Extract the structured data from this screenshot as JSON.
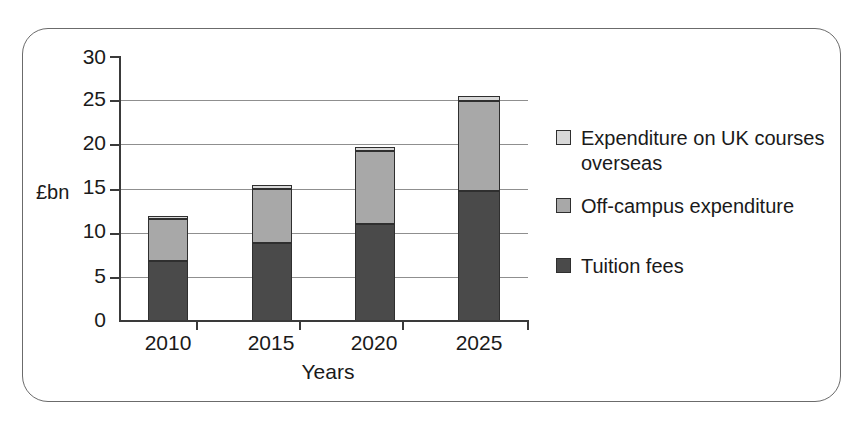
{
  "chart_data": {
    "type": "bar",
    "subtype": "stacked-vertical",
    "title": "",
    "xlabel": "Years",
    "ylabel": "£bn",
    "categories": [
      "2010",
      "2015",
      "2020",
      "2025"
    ],
    "series": [
      {
        "name": "Tuition fees",
        "color": "#4a4a4a",
        "values": [
          6.8,
          8.8,
          11.0,
          14.7
        ]
      },
      {
        "name": "Off-campus expenditure",
        "color": "#a8a8a8",
        "values": [
          4.7,
          6.2,
          8.2,
          10.2
        ]
      },
      {
        "name": "Expenditure on UK courses overseas",
        "color": "#d8d8d8",
        "values": [
          0.4,
          0.35,
          0.45,
          0.55
        ]
      }
    ],
    "totals": [
      11.9,
      15.35,
      19.65,
      25.45
    ],
    "ylim": [
      0,
      30
    ],
    "ytick_values": [
      0,
      5,
      10,
      15,
      20,
      25,
      30
    ],
    "ytick_labels": [
      "0",
      "5",
      "10",
      "15",
      "20",
      "25",
      "30"
    ],
    "grid": "horizontal",
    "legend_position": "right"
  },
  "axes": {
    "y_title": "£bn",
    "x_title": "Years",
    "y_ticks": [
      "30",
      "25",
      "20",
      "15",
      "10",
      "5",
      "0"
    ],
    "x_ticks": [
      "2010",
      "2015",
      "2020",
      "2025"
    ]
  },
  "legend": {
    "items": [
      {
        "label": "Expenditure on UK courses overseas",
        "color": "#d8d8d8"
      },
      {
        "label": "Off-campus expenditure",
        "color": "#a8a8a8"
      },
      {
        "label": "Tuition fees",
        "color": "#4a4a4a"
      }
    ]
  },
  "colors": {
    "tuition_fees": "#4a4a4a",
    "off_campus": "#a8a8a8",
    "overseas": "#d8d8d8",
    "axis": "#3a3a3a",
    "gridline": "#8f8f8f",
    "frame_border": "#6b6b6b",
    "background": "#ffffff"
  }
}
